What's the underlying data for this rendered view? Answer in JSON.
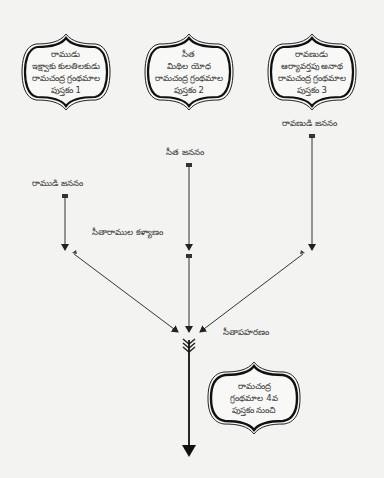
{
  "diagram": {
    "type": "flow-timeline",
    "source_boxes": [
      {
        "id": "box1",
        "lines": [
          "రాముడు",
          "ఇక్ష్వాకు కులతిలకుడు",
          "రామచంద్ర గ్రంథమాల",
          "పుస్తకం 1"
        ]
      },
      {
        "id": "box2",
        "lines": [
          "సీత",
          "మిథిల యోధ",
          "రామచంద్ర గ్రంథమాల",
          "పుస్తకం 2"
        ]
      },
      {
        "id": "box3",
        "lines": [
          "రావణుడు",
          "ఆర్యావర్తపు అనాథ",
          "రామచంద్ర గ్రంథమాల",
          "పుస్తకం 3"
        ]
      }
    ],
    "events": {
      "rama_birth": "రాముడి జననం",
      "sita_birth": "సీత జననం",
      "ravana_birth": "రావణుడి జననం",
      "wedding": "సీతారాముల కళ్యాణం",
      "abduction": "సీతాపహరణం"
    },
    "target_box": {
      "id": "box4",
      "lines": [
        "రామచంద్ర",
        "గ్రంథమాల 4వ",
        "పుస్తకం నుంచి"
      ]
    },
    "colors": {
      "background": "#f3f3f1",
      "line": "#222222",
      "text": "#333333"
    }
  }
}
